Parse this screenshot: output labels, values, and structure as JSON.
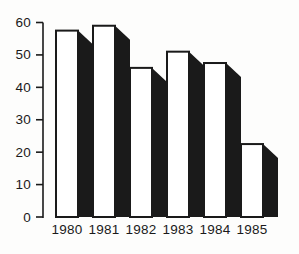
{
  "figure": {
    "background": "#fdfdfc",
    "ink": "#1a1a1a"
  },
  "chart_data": {
    "type": "bar",
    "title": "",
    "xlabel": "",
    "ylabel": "",
    "categories": [
      "1980",
      "1981",
      "1982",
      "1983",
      "1984",
      "1985"
    ],
    "values": [
      57.5,
      59,
      46,
      51,
      47.5,
      22.5
    ],
    "ylim": [
      0,
      60
    ],
    "yticks": [
      0,
      10,
      20,
      30,
      40,
      50,
      60
    ],
    "grid": false,
    "legend": "none",
    "style": {
      "bar_fill": "#ffffff",
      "bar_outline": "#1a1a1a",
      "shadow_color": "#1a1a1a",
      "effect": "3d-drop-shadow-right"
    }
  }
}
